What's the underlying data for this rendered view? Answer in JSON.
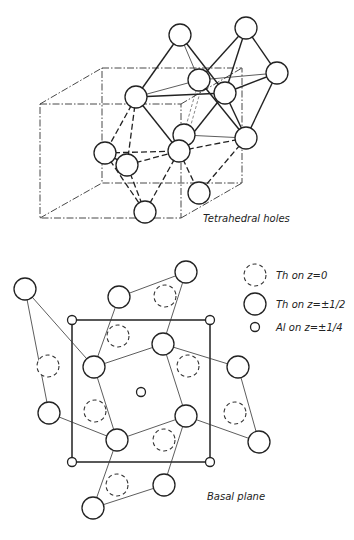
{
  "figure": {
    "top_panel": {
      "label": "Tetrahedral holes",
      "unit_cell_box": {
        "front": {
          "x1": 40,
          "y1": 104,
          "x2": 181,
          "y2": 218
        },
        "back": {
          "x1": 102,
          "y1": 68,
          "x2": 242,
          "y2": 183
        }
      },
      "atoms": [
        {
          "id": "A",
          "x": 180,
          "y": 35
        },
        {
          "id": "B",
          "x": 246,
          "y": 28
        },
        {
          "id": "C",
          "x": 277,
          "y": 73
        },
        {
          "id": "D",
          "x": 199,
          "y": 80
        },
        {
          "id": "E",
          "x": 225,
          "y": 93
        },
        {
          "id": "F",
          "x": 136,
          "y": 97
        },
        {
          "id": "K",
          "x": 184,
          "y": 135
        },
        {
          "id": "L",
          "x": 246,
          "y": 138
        },
        {
          "id": "G",
          "x": 105,
          "y": 153
        },
        {
          "id": "I",
          "x": 179,
          "y": 151
        },
        {
          "id": "H",
          "x": 127,
          "y": 165
        },
        {
          "id": "M",
          "x": 199,
          "y": 193
        },
        {
          "id": "J",
          "x": 145,
          "y": 212
        }
      ]
    },
    "bottom_panel": {
      "label": "Basal plane",
      "legend": [
        {
          "symbol": "dashed-circle",
          "text": "Th on z=0"
        },
        {
          "symbol": "large-circle",
          "text": "Th on z=±1/2"
        },
        {
          "symbol": "small-circle",
          "text": "Al on z=±1/4"
        }
      ],
      "unit_cell": {
        "x1": 72,
        "y1": 320,
        "x2": 210,
        "y2": 462
      },
      "al_atoms": [
        [
          72,
          320
        ],
        [
          210,
          320
        ],
        [
          72,
          462
        ],
        [
          210,
          462
        ],
        [
          141,
          392
        ]
      ],
      "th_half": [
        [
          186,
          272
        ],
        [
          119,
          297
        ],
        [
          25,
          289
        ],
        [
          163,
          344
        ],
        [
          94,
          367
        ],
        [
          238,
          367
        ],
        [
          49,
          413
        ],
        [
          186,
          416
        ],
        [
          117,
          440
        ],
        [
          259,
          442
        ],
        [
          164,
          485
        ],
        [
          93,
          508
        ]
      ],
      "th_zero": [
        [
          165,
          296
        ],
        [
          118,
          336
        ],
        [
          48,
          366
        ],
        [
          188,
          366
        ],
        [
          95,
          411
        ],
        [
          235,
          413
        ],
        [
          164,
          440
        ],
        [
          117,
          485
        ]
      ]
    }
  }
}
